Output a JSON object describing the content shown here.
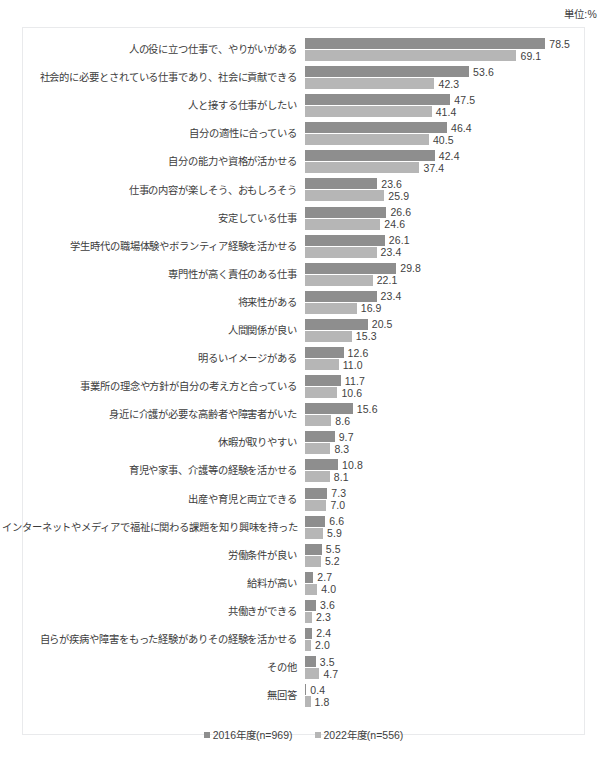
{
  "unit_note": "単位:%",
  "legend": {
    "position": "bottom-center",
    "items": [
      {
        "label": "■2016年度(n=969)",
        "name": "2016年度",
        "n": 969,
        "color": "#8e8e8e"
      },
      {
        "label": "■2022年度(n=556)",
        "name": "2022年度",
        "n": 556,
        "color": "#b6b6b6"
      }
    ]
  },
  "chart_data": {
    "type": "bar",
    "orientation": "horizontal",
    "title": "",
    "subtitle": "",
    "xlabel": "",
    "ylabel": "",
    "unit": "%",
    "grid": false,
    "legend_position": "bottom-center",
    "xlim": [
      0,
      85
    ],
    "value_labels": true,
    "categories": [
      "人の役に立つ仕事で、やりがいがある",
      "社会的に必要とされている仕事であり、社会に貢献できる",
      "人と接する仕事がしたい",
      "自分の適性に合っている",
      "自分の能力や資格が活かせる",
      "仕事の内容が楽しそう、おもしろそう",
      "安定している仕事",
      "学生時代の職場体験やボランティア経験を活かせる",
      "専門性が高く責任のある仕事",
      "将来性がある",
      "人間関係が良い",
      "明るいイメージがある",
      "事業所の理念や方針が自分の考え方と合っている",
      "身近に介護が必要な高齢者や障害者がいた",
      "休暇が取りやすい",
      "育児や家事、介護等の経験を活かせる",
      "出産や育児と両立できる",
      "インターネットやメディアで福祉に関わる課題を知り興味を持った",
      "労働条件が良い",
      "給料が高い",
      "共働きができる",
      "自らが疾病や障害をもった経験がありその経験を活かせる",
      "その他",
      "無回答"
    ],
    "series": [
      {
        "name": "2016年度(n=969)",
        "color": "#8e8e8e",
        "values": [
          78.5,
          53.6,
          47.5,
          46.4,
          42.4,
          23.6,
          26.6,
          26.1,
          29.8,
          23.4,
          20.5,
          12.6,
          11.7,
          15.6,
          9.7,
          10.8,
          7.3,
          6.6,
          5.5,
          2.7,
          3.6,
          2.4,
          3.5,
          0.4
        ]
      },
      {
        "name": "2022年度(n=556)",
        "color": "#b6b6b6",
        "values": [
          69.1,
          42.3,
          41.4,
          40.5,
          37.4,
          25.9,
          24.6,
          23.4,
          22.1,
          16.9,
          15.3,
          11.0,
          10.6,
          8.6,
          8.3,
          8.1,
          7.0,
          5.9,
          5.2,
          4.0,
          2.3,
          2.0,
          4.7,
          1.8
        ]
      }
    ]
  }
}
